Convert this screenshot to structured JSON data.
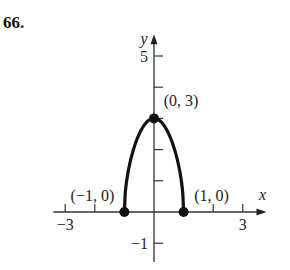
{
  "problem_number": "66.",
  "chart_data": {
    "type": "line",
    "title": "",
    "xlabel": "x",
    "ylabel": "y",
    "xlim": [
      -3.4,
      3.8
    ],
    "ylim": [
      -1.6,
      5.7
    ],
    "x_ticks": [
      -3,
      -2,
      -1,
      1,
      2,
      3
    ],
    "x_tick_labels": {
      "-3": "−3",
      "3": "3"
    },
    "y_ticks": [
      -1,
      1,
      2,
      3,
      4,
      5
    ],
    "y_tick_labels": {
      "-1": "−1",
      "5": "5"
    },
    "grid": false,
    "series": [
      {
        "name": "curve",
        "description": "arch from (-1,0) up to (0,3) down to (1,0)",
        "x": [
          -1,
          -0.5,
          0,
          0.5,
          1
        ],
        "y": [
          0,
          2.6,
          3,
          2.6,
          0
        ]
      }
    ],
    "points": [
      {
        "x": -1,
        "y": 0,
        "label": "(−1, 0)"
      },
      {
        "x": 0,
        "y": 3,
        "label": "(0, 3)"
      },
      {
        "x": 1,
        "y": 0,
        "label": "(1, 0)"
      }
    ]
  }
}
